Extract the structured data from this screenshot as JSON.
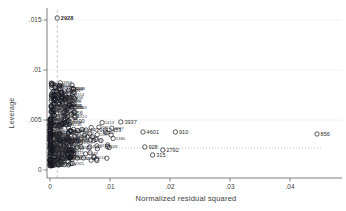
{
  "figure": {
    "background": "#ffffff",
    "axis_color": "#707070",
    "tick_text_color": "#404040",
    "marker_color": "#181822",
    "label_text_color": "#3f3f3f",
    "gridline_color": "#efefef",
    "ref_line_color": "#bdbdbd"
  },
  "chart_data": {
    "type": "scatter",
    "title": "",
    "xlabel": "Normalized residual squared",
    "ylabel": "Leverage",
    "xlim": [
      0,
      0.049
    ],
    "ylim": [
      0,
      0.017
    ],
    "x_ticks": [
      0,
      0.01,
      0.02,
      0.03,
      0.04
    ],
    "x_tick_labels": [
      "0",
      ".01",
      ".02",
      ".03",
      ".04"
    ],
    "y_ticks": [
      0,
      0.005,
      0.01,
      0.015
    ],
    "y_tick_labels": [
      "0",
      ".005",
      ".01",
      ".015"
    ],
    "grid": "horizontal-light",
    "legend": "none",
    "marker": {
      "shape": "hollow-circle",
      "size_px": 4.4,
      "color": "#181822"
    },
    "ref_lines": {
      "vertical_dashed": {
        "x": 0.0012,
        "style": "dashed",
        "note": "mean normalized residual squared"
      },
      "horizontal_dotted": {
        "y": 0.0022,
        "x_end": 0.0455,
        "style": "dotted",
        "note": "mean leverage"
      }
    },
    "labeled_points": [
      {
        "label": "2928",
        "x": 0.0012,
        "y": 0.0152,
        "bold": true
      },
      {
        "label": "3937",
        "x": 0.0118,
        "y": 0.0048,
        "bold": false
      },
      {
        "label": "4601",
        "x": 0.0155,
        "y": 0.0038,
        "bold": false
      },
      {
        "label": "910",
        "x": 0.0209,
        "y": 0.0038,
        "bold": false
      },
      {
        "label": "856",
        "x": 0.0445,
        "y": 0.0036,
        "bold": false
      },
      {
        "label": "2792",
        "x": 0.0188,
        "y": 0.002,
        "bold": false
      },
      {
        "label": "315",
        "x": 0.0171,
        "y": 0.0015,
        "bold": false
      },
      {
        "label": "3056",
        "x": 0.0028,
        "y": 0.0057,
        "bold": false
      },
      {
        "label": "4900",
        "x": 0.0031,
        "y": 0.0049,
        "bold": false
      },
      {
        "label": "4439",
        "x": 0.006,
        "y": 0.004,
        "bold": false
      },
      {
        "label": "2453",
        "x": 0.0092,
        "y": 0.004,
        "bold": false
      },
      {
        "label": "928",
        "x": 0.0158,
        "y": 0.0023,
        "bold": false
      }
    ],
    "cluster": {
      "description": "dense overlapping mass of hollow-circle markers with tiny illegible numeric observation labels near the origin",
      "labels_illegible": true,
      "seed": 7,
      "blobs": [
        {
          "count": 260,
          "x_min": 0.0,
          "x_max": 0.004,
          "y_min": 0.0004,
          "y_max": 0.0052,
          "x_skew": 2.2,
          "label_prob": 0.45
        },
        {
          "count": 130,
          "x_min": 0.0002,
          "x_max": 0.0042,
          "y_min": 0.0052,
          "y_max": 0.0088,
          "x_skew": 1.6,
          "label_prob": 0.5
        },
        {
          "count": 70,
          "x_min": 0.003,
          "x_max": 0.011,
          "y_min": 0.0008,
          "y_max": 0.0048,
          "x_skew": 1.8,
          "label_prob": 0.4
        }
      ]
    }
  }
}
